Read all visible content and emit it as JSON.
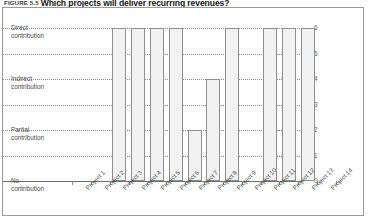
{
  "figure": {
    "number": "FIGURE 5.5",
    "title": "Which projects will deliver recurring revenues?"
  },
  "chart_data": {
    "type": "bar",
    "title": "Which projects will deliver recurring revenues?",
    "xlabel": "",
    "ylabel": "",
    "ylim": [
      0,
      6
    ],
    "grid": true,
    "legend": "none",
    "categories": [
      "Project 1",
      "Project 2",
      "Project 3",
      "Project 4",
      "Project 5",
      "Project 6",
      "Project 7",
      "Project 8",
      "Project 9",
      "Project 10",
      "Project 11",
      "Project 12",
      "Project 13",
      "Project 14"
    ],
    "values": [
      0,
      0,
      6,
      6,
      6,
      6,
      2,
      4,
      6,
      0,
      6,
      6,
      6,
      0
    ],
    "y_ticks_right": [
      "6",
      "5",
      "4",
      "3",
      "2",
      "1",
      "0"
    ],
    "y_tick_values": [
      6,
      5,
      4,
      3,
      2,
      1,
      0
    ],
    "y_category_labels": [
      {
        "value": 6,
        "line1": "Direct",
        "line2": "contribution"
      },
      {
        "value": 4,
        "line1": "Indirect",
        "line2": "contribution"
      },
      {
        "value": 2,
        "line1": "Partial",
        "line2": "contribution"
      },
      {
        "value": 0,
        "line1": "No",
        "line2": "contribution"
      }
    ],
    "colors": {
      "bar_fill": "#f2f2f2",
      "bar_stroke": "#8f8f8f",
      "grid": "#8d8d8d",
      "axis": "#6e6e6e",
      "text": "#4a4a4a"
    }
  }
}
